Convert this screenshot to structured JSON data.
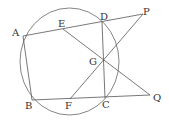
{
  "diagram": {
    "type": "geometry",
    "stroke_color": "#555555",
    "circle": {
      "cx": 69.5,
      "cy": 61.5,
      "rx": 49.5,
      "ry": 53.5
    },
    "points": {
      "A": {
        "x": 23,
        "y": 36,
        "label": "A"
      },
      "B": {
        "x": 32,
        "y": 100,
        "label": "B"
      },
      "C": {
        "x": 105,
        "y": 98,
        "label": "C"
      },
      "D": {
        "x": 102,
        "y": 22,
        "label": "D"
      },
      "E": {
        "x": 63,
        "y": 29,
        "label": "E"
      },
      "F": {
        "x": 70,
        "y": 99,
        "label": "F"
      },
      "G": {
        "x": 103,
        "y": 60,
        "label": "G"
      },
      "P": {
        "x": 143,
        "y": 14,
        "label": "P"
      },
      "Q": {
        "x": 150,
        "y": 95,
        "label": "Q"
      }
    },
    "segments": [
      [
        "A",
        "P"
      ],
      [
        "A",
        "B"
      ],
      [
        "B",
        "Q"
      ],
      [
        "D",
        "C"
      ],
      [
        "E",
        "Q"
      ],
      [
        "F",
        "P"
      ]
    ],
    "labels": {
      "A": "A",
      "B": "B",
      "C": "C",
      "D": "D",
      "E": "E",
      "F": "F",
      "G": "G",
      "P": "P",
      "Q": "Q"
    }
  }
}
